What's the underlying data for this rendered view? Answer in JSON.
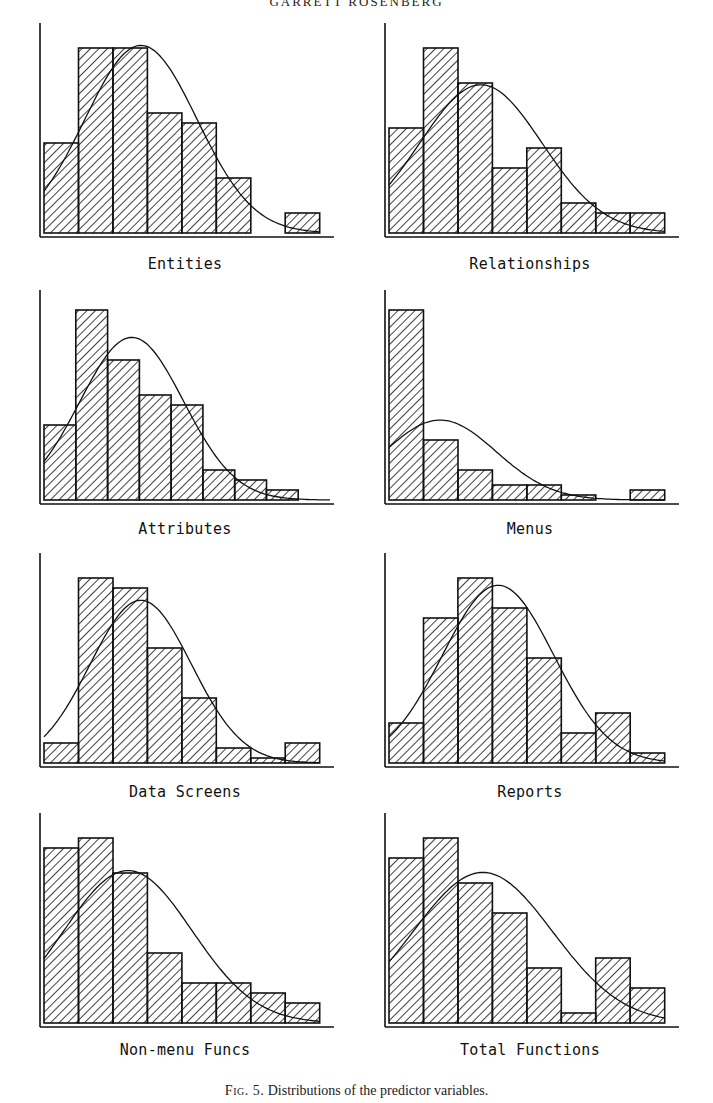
{
  "header": {
    "running_title": "GARRETT ROSENBERG"
  },
  "caption": {
    "fig_label": "Fig. 5.",
    "text": "Distributions of the predictor variables."
  },
  "chart_data": [
    {
      "type": "bar",
      "title": "Entities",
      "xlabel": "Entities",
      "ylabel": "",
      "categories": [
        "1",
        "2",
        "3",
        "4",
        "5",
        "6",
        "7",
        "8"
      ],
      "values": [
        18,
        37,
        37,
        24,
        22,
        11,
        0,
        4
      ],
      "ylim": [
        0,
        40
      ],
      "overlay": "normal curve",
      "grid": false
    },
    {
      "type": "bar",
      "title": "Relationships",
      "xlabel": "Relationships",
      "ylabel": "",
      "categories": [
        "1",
        "2",
        "3",
        "4",
        "5",
        "6",
        "7",
        "8"
      ],
      "values": [
        21,
        37,
        30,
        13,
        17,
        6,
        4,
        4
      ],
      "ylim": [
        0,
        40
      ],
      "overlay": "normal curve",
      "grid": false
    },
    {
      "type": "bar",
      "title": "Attributes",
      "xlabel": "Attributes",
      "ylabel": "",
      "categories": [
        "1",
        "2",
        "3",
        "4",
        "5",
        "6",
        "7",
        "8",
        "9"
      ],
      "values": [
        15,
        38,
        28,
        21,
        19,
        6,
        4,
        2,
        0
      ],
      "ylim": [
        0,
        40
      ],
      "overlay": "normal curve",
      "grid": false
    },
    {
      "type": "bar",
      "title": "Menus",
      "xlabel": "Menus",
      "ylabel": "",
      "categories": [
        "1",
        "2",
        "3",
        "4",
        "5",
        "6",
        "7",
        "8"
      ],
      "values": [
        38,
        12,
        6,
        3,
        3,
        1,
        0,
        2
      ],
      "ylim": [
        0,
        40
      ],
      "overlay": "normal curve",
      "grid": false
    },
    {
      "type": "bar",
      "title": "Data Screens",
      "xlabel": "Data Screens",
      "ylabel": "",
      "categories": [
        "1",
        "2",
        "3",
        "4",
        "5",
        "6",
        "7",
        "8"
      ],
      "values": [
        4,
        37,
        35,
        23,
        13,
        3,
        1,
        4
      ],
      "ylim": [
        0,
        40
      ],
      "overlay": "normal curve",
      "grid": false
    },
    {
      "type": "bar",
      "title": "Reports",
      "xlabel": "Reports",
      "ylabel": "",
      "categories": [
        "1",
        "2",
        "3",
        "4",
        "5",
        "6",
        "7",
        "8"
      ],
      "values": [
        8,
        29,
        37,
        31,
        21,
        6,
        10,
        2
      ],
      "ylim": [
        0,
        40
      ],
      "overlay": "normal curve",
      "grid": false
    },
    {
      "type": "bar",
      "title": "Non-menu Funcs",
      "xlabel": "Non-menu Funcs",
      "ylabel": "",
      "categories": [
        "1",
        "2",
        "3",
        "4",
        "5",
        "6",
        "7",
        "8"
      ],
      "values": [
        35,
        37,
        30,
        14,
        8,
        8,
        6,
        4
      ],
      "ylim": [
        0,
        40
      ],
      "overlay": "normal curve",
      "grid": false
    },
    {
      "type": "bar",
      "title": "Total Functions",
      "xlabel": "Total Functions",
      "ylabel": "",
      "categories": [
        "1",
        "2",
        "3",
        "4",
        "5",
        "6",
        "7",
        "8"
      ],
      "values": [
        33,
        37,
        28,
        22,
        11,
        2,
        13,
        7
      ],
      "ylim": [
        0,
        40
      ],
      "overlay": "normal curve",
      "grid": false
    }
  ],
  "panels": [
    {
      "label": "Entities"
    },
    {
      "label": "Relationships"
    },
    {
      "label": "Attributes"
    },
    {
      "label": "Menus"
    },
    {
      "label": "Data Screens"
    },
    {
      "label": "Reports"
    },
    {
      "label": "Non-menu Funcs"
    },
    {
      "label": "Total Functions"
    }
  ]
}
